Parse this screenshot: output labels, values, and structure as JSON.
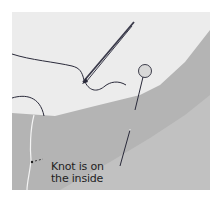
{
  "illustration": {
    "subject": "sewing instruction: hand stitching fabric edge with needle and pin",
    "caption": {
      "line1": "Knot is on",
      "line2": "the inside"
    },
    "colors": {
      "background": "#ececec",
      "fabric_dark": "#b4b4b4",
      "fabric_light": "#c2c2c2",
      "thread": "#2a2a3a",
      "needle": "#3a3a4a",
      "inner_thread": "#f4f4f4",
      "pin_head": "#d8d8d8"
    }
  }
}
